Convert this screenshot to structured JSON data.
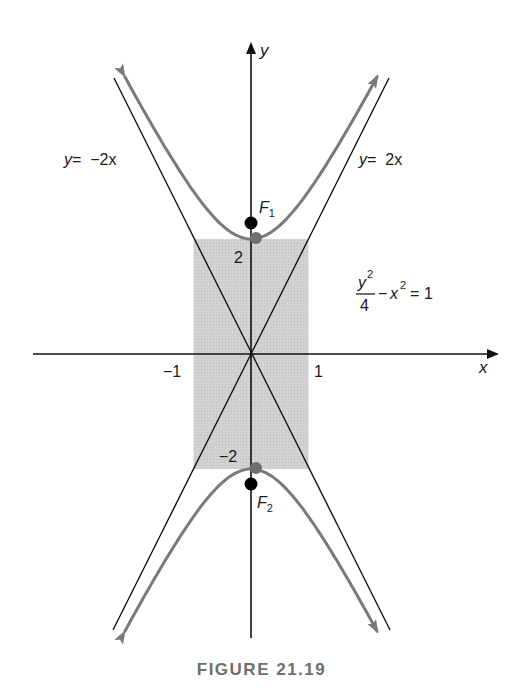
{
  "chart_data": {
    "type": "line",
    "title": "",
    "caption": "FIGURE 21.19",
    "xlabel": "x",
    "ylabel": "y",
    "equation": {
      "numerator": "y",
      "numerator_exp": "2",
      "denominator": "4",
      "rest_base": "x",
      "rest_exp": "2",
      "rhs": "1",
      "text": "y^2/4 - x^2 = 1"
    },
    "asymptotes": [
      {
        "label": "y = 2x",
        "label_text_lhs": "y",
        "label_text_rhs": "=  2x",
        "slope": 2
      },
      {
        "label": "y = -2x",
        "label_text_lhs": "y",
        "label_text_rhs": "=  −2x",
        "slope": -2
      }
    ],
    "x_ticks": [
      {
        "value": -1,
        "label": "−1"
      },
      {
        "value": 1,
        "label": "1"
      }
    ],
    "y_ticks": [
      {
        "value": 2,
        "label": "2"
      },
      {
        "value": -2,
        "label": "−2"
      }
    ],
    "xlim": [
      -4.36,
      4.3
    ],
    "ylim": [
      -4.9,
      5.4
    ],
    "shaded_rectangle": {
      "x": [
        -1,
        1
      ],
      "y": [
        -2,
        2
      ],
      "color": "#cfcfcf"
    },
    "vertices": [
      {
        "x": 0,
        "y": 2
      },
      {
        "x": 0,
        "y": -2
      }
    ],
    "foci": [
      {
        "name": "F",
        "sub": "1",
        "label": "F1",
        "x": 0,
        "y": 2.236
      },
      {
        "name": "F",
        "sub": "2",
        "label": "F2",
        "x": 0,
        "y": -2.236
      }
    ],
    "series": [
      {
        "name": "upper branch",
        "x": [
          -2.0,
          -1.5,
          -1.0,
          -0.5,
          0,
          0.5,
          1.0,
          1.5,
          2.0
        ],
        "y": [
          4.47,
          3.61,
          2.83,
          2.24,
          2.0,
          2.24,
          2.83,
          3.61,
          4.47
        ]
      },
      {
        "name": "lower branch",
        "x": [
          -2.0,
          -1.5,
          -1.0,
          -0.5,
          0,
          0.5,
          1.0,
          1.5,
          2.0
        ],
        "y": [
          -4.47,
          -3.61,
          -2.83,
          -2.24,
          -2.0,
          -2.24,
          -2.83,
          -3.61,
          -4.47
        ]
      }
    ],
    "colors": {
      "curve": "#7a7a7a",
      "axes": "#111111",
      "shade": "#cfcfcf",
      "focus": "#000000",
      "vertex": "#6f6f6f",
      "caption": "#6e6e6e"
    },
    "grid": false
  }
}
